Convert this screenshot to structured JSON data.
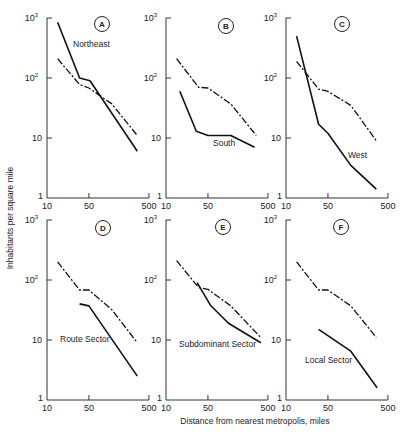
{
  "figure": {
    "ylabel": "Inhabitants per square mile",
    "xlabel": "Distance from nearest metropolis, miles",
    "x_ticks": [
      "10",
      "50",
      "500"
    ],
    "y_ticks": [
      "1",
      "10",
      "10^2",
      "10^3"
    ]
  },
  "chart_data": [
    {
      "type": "line",
      "panel": "A",
      "title": "Northeast",
      "xlabel": "Distance from nearest metropolis, miles",
      "ylabel": "Inhabitants per square mile",
      "xscale": "log",
      "yscale": "log",
      "xlim": [
        10,
        500
      ],
      "ylim": [
        1,
        1000
      ],
      "series": [
        {
          "name": "Northeast",
          "style": "solid",
          "points": [
            [
              15,
              850
            ],
            [
              35,
              100
            ],
            [
              52,
              90
            ],
            [
              320,
              6
            ]
          ]
        },
        {
          "name": "Reference (all regions)",
          "style": "dashed",
          "points": [
            [
              15,
              210
            ],
            [
              35,
              78
            ],
            [
              50,
              68
            ],
            [
              120,
              37
            ],
            [
              320,
              11
            ]
          ]
        }
      ]
    },
    {
      "type": "line",
      "panel": "B",
      "title": "South",
      "xscale": "log",
      "yscale": "log",
      "xlim": [
        10,
        500
      ],
      "ylim": [
        1,
        1000
      ],
      "series": [
        {
          "name": "South",
          "style": "solid",
          "points": [
            [
              17,
              60
            ],
            [
              32,
              13
            ],
            [
              50,
              11
            ],
            [
              120,
              11
            ],
            [
              300,
              7
            ]
          ]
        },
        {
          "name": "Reference (all regions)",
          "style": "dashed",
          "points": [
            [
              15,
              210
            ],
            [
              35,
              70
            ],
            [
              50,
              68
            ],
            [
              120,
              37
            ],
            [
              320,
              11
            ]
          ]
        }
      ]
    },
    {
      "type": "line",
      "panel": "C",
      "title": "West",
      "xscale": "log",
      "yscale": "log",
      "xlim": [
        10,
        500
      ],
      "ylim": [
        1,
        1000
      ],
      "series": [
        {
          "name": "West",
          "style": "solid",
          "points": [
            [
              15,
              500
            ],
            [
              35,
              17
            ],
            [
              50,
              12
            ],
            [
              120,
              3.5
            ],
            [
              320,
              1.4
            ]
          ]
        },
        {
          "name": "Reference (all regions)",
          "style": "dashed",
          "points": [
            [
              15,
              190
            ],
            [
              35,
              65
            ],
            [
              50,
              60
            ],
            [
              120,
              35
            ],
            [
              320,
              9
            ]
          ]
        }
      ]
    },
    {
      "type": "line",
      "panel": "D",
      "title": "Route Sector",
      "xscale": "log",
      "yscale": "log",
      "xlim": [
        10,
        500
      ],
      "ylim": [
        1,
        1000
      ],
      "series": [
        {
          "name": "Route Sector",
          "style": "solid",
          "points": [
            [
              35,
              40
            ],
            [
              50,
              37
            ],
            [
              320,
              2.5
            ]
          ]
        },
        {
          "name": "Reference (all regions)",
          "style": "dashed",
          "points": [
            [
              15,
              200
            ],
            [
              35,
              68
            ],
            [
              50,
              68
            ],
            [
              120,
              32
            ],
            [
              320,
              9
            ]
          ]
        }
      ]
    },
    {
      "type": "line",
      "panel": "E",
      "title": "Subdominant Sector",
      "xscale": "log",
      "yscale": "log",
      "xlim": [
        10,
        500
      ],
      "ylim": [
        1,
        1000
      ],
      "series": [
        {
          "name": "Subdominant Sector",
          "style": "solid",
          "points": [
            [
              33,
              90
            ],
            [
              55,
              38
            ],
            [
              110,
              19
            ],
            [
              380,
              9
            ]
          ]
        },
        {
          "name": "Reference (all regions)",
          "style": "dashed",
          "points": [
            [
              15,
              210
            ],
            [
              35,
              75
            ],
            [
              50,
              70
            ],
            [
              120,
              37
            ],
            [
              380,
              11
            ]
          ]
        }
      ]
    },
    {
      "type": "line",
      "panel": "F",
      "title": "Local Sector",
      "xscale": "log",
      "yscale": "log",
      "xlim": [
        10,
        500
      ],
      "ylim": [
        1,
        1000
      ],
      "series": [
        {
          "name": "Local Sector",
          "style": "solid",
          "points": [
            [
              35,
              15
            ],
            [
              120,
              6.5
            ],
            [
              330,
              1.6
            ]
          ]
        },
        {
          "name": "Reference (all regions)",
          "style": "dashed",
          "points": [
            [
              15,
              200
            ],
            [
              35,
              68
            ],
            [
              50,
              68
            ],
            [
              120,
              37
            ],
            [
              320,
              11
            ]
          ]
        }
      ]
    }
  ],
  "panels": [
    {
      "letter": "A",
      "label": "Northeast",
      "ox": 47,
      "oy": 198,
      "label_x": 73,
      "label_y": 47,
      "circle_x": 102,
      "circle_y": 24
    },
    {
      "letter": "B",
      "label": "South",
      "ox": 166,
      "oy": 198,
      "label_x": 213,
      "label_y": 146,
      "circle_x": 226,
      "circle_y": 26
    },
    {
      "letter": "C",
      "label": "West",
      "ox": 286,
      "oy": 198,
      "label_x": 348,
      "label_y": 158,
      "circle_x": 342,
      "circle_y": 24
    },
    {
      "letter": "D",
      "label": "Route Sector",
      "ox": 47,
      "oy": 400,
      "label_x": 60,
      "label_y": 342,
      "circle_x": 103,
      "circle_y": 228
    },
    {
      "letter": "E",
      "label": "Subdominant Sector",
      "ox": 166,
      "oy": 400,
      "label_x": 179,
      "label_y": 347,
      "circle_x": 223,
      "circle_y": 227
    },
    {
      "letter": "F",
      "label": "Local Sector",
      "ox": 286,
      "oy": 400,
      "label_x": 305,
      "label_y": 363,
      "circle_x": 341,
      "circle_y": 227
    }
  ]
}
